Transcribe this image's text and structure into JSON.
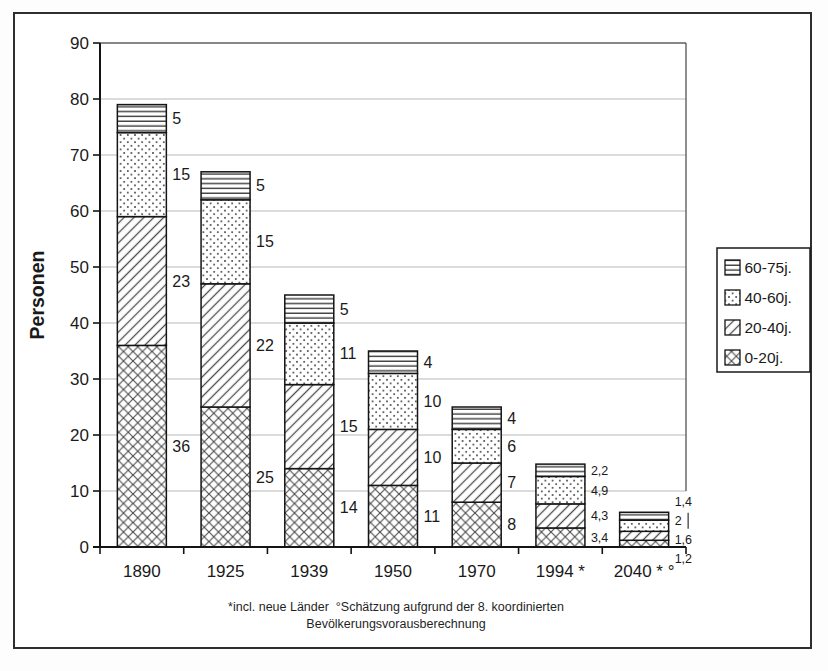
{
  "chart_data": {
    "type": "bar",
    "stacked": true,
    "title": "",
    "ylabel": "Personen",
    "xlabel": "",
    "ylim": [
      0,
      90
    ],
    "ytick_step": 10,
    "yticks": [
      0,
      10,
      20,
      30,
      40,
      50,
      60,
      70,
      80,
      90
    ],
    "grid": true,
    "legend_position": "right",
    "categories": [
      "1890",
      "1925",
      "1939",
      "1950",
      "1970",
      "1994 *",
      "2040 * °"
    ],
    "series": [
      {
        "name": "0-20j.",
        "pattern": "crosshatch",
        "values": [
          36,
          25,
          14,
          11,
          8,
          3.4,
          1.2
        ]
      },
      {
        "name": "20-40j.",
        "pattern": "diagonal",
        "values": [
          23,
          22,
          15,
          10,
          7,
          4.3,
          1.6
        ]
      },
      {
        "name": "40-60j.",
        "pattern": "dots",
        "values": [
          15,
          15,
          11,
          10,
          6,
          4.9,
          2
        ]
      },
      {
        "name": "60-75j.",
        "pattern": "hlines",
        "values": [
          5,
          5,
          5,
          4,
          4,
          2.2,
          1.4
        ]
      }
    ],
    "bar_totals": [
      79,
      67,
      45,
      35,
      25,
      14.8,
      6.2
    ],
    "legend_order_top_to_bottom": [
      "60-75j.",
      "40-60j.",
      "20-40j.",
      "0-20j."
    ],
    "value_label_decimal_separator": ",",
    "annotations": {
      "leader_line": {
        "category_index": 6,
        "series_name": "40-60j."
      }
    },
    "footnote_line1": "*incl. neue Länder  °Schätzung aufgrund der 8. koordinierten",
    "footnote_line2": "Bevölkerungsvorausberechnung",
    "colors": {
      "ink": "#141414",
      "grid": "#b8b8b8",
      "plot_border": "#5f5f5f",
      "pattern_stroke": "#4d4d4d",
      "frame": "#2e2e2e",
      "background": "#ffffff"
    }
  }
}
